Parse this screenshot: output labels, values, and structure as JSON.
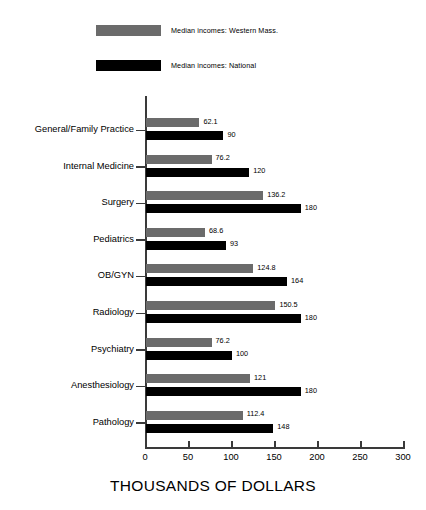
{
  "chart_data": {
    "type": "bar",
    "orientation": "horizontal",
    "title": "",
    "xlabel": "THOUSANDS OF DOLLARS",
    "ylabel": "",
    "xlim": [
      0,
      300
    ],
    "xticks": [
      0,
      50,
      100,
      150,
      200,
      250,
      300
    ],
    "grid": false,
    "legend_position": "top-left",
    "categories": [
      "General/Family Practice",
      "Internal Medicine",
      "Surgery",
      "Pediatrics",
      "OB/GYN",
      "Radiology",
      "Psychiatry",
      "Anesthesiology",
      "Pathology"
    ],
    "series": [
      {
        "name": "Median incomes: Western Mass.",
        "color": "#6b6b6b",
        "values": [
          62.1,
          76.2,
          136.2,
          68.6,
          124.8,
          150.5,
          76.2,
          121,
          112.4
        ],
        "labels": [
          "62.1",
          "76.2",
          "136.2",
          "68.6",
          "124.8",
          "150.5",
          "76.2",
          "121",
          "112.4"
        ]
      },
      {
        "name": "Median incomes: National",
        "color": "#000000",
        "values": [
          90,
          120,
          180,
          93,
          164,
          180,
          100,
          180,
          148
        ],
        "labels": [
          "90",
          "120",
          "180",
          "93",
          "164",
          "180",
          "100",
          "180",
          "148"
        ]
      }
    ]
  },
  "legend": {
    "items": [
      {
        "label": "Median incomes: Western Mass.",
        "color": "#6b6b6b"
      },
      {
        "label": "Median incomes: National",
        "color": "#000000"
      }
    ]
  },
  "axis": {
    "x_title": "THOUSANDS OF DOLLARS",
    "tick_labels": [
      "0",
      "50",
      "100",
      "150",
      "200",
      "250",
      "300"
    ]
  }
}
